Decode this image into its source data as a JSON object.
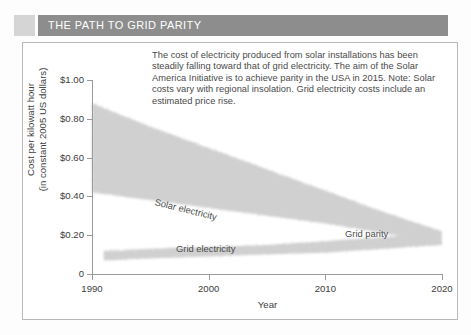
{
  "header": {
    "title": "THE PATH TO GRID PARITY",
    "swatch_color": "#d5d5d5",
    "bar_color": "#8d8d8d",
    "title_color": "#ffffff"
  },
  "caption": {
    "text": "The cost of electricity produced from solar installations has been steadily falling toward that of grid electricity. The aim of the Solar America Initiative is to achieve parity in the USA in 2015. Note: Solar costs vary with regional insolation. Grid electricity costs include an estimated price rise."
  },
  "chart_data": {
    "type": "area",
    "title": "THE PATH TO GRID PARITY",
    "xlabel": "Year",
    "ylabel": "Cost per kilowatt hour (in constant 2005 US dollars)",
    "ylabel_line1": "Cost per kilowatt hour",
    "ylabel_line2": "(in constant 2005 US dollars)",
    "xlim": [
      1990,
      2020
    ],
    "ylim": [
      0,
      1.0
    ],
    "grid": false,
    "legend": "none",
    "xticks": [
      1990,
      2000,
      2010,
      2020
    ],
    "xtick_labels": [
      "1990",
      "2000",
      "2010",
      "2020"
    ],
    "yticks": [
      0,
      0.2,
      0.4,
      0.6,
      0.8,
      1.0
    ],
    "ytick_labels": [
      "0",
      "$0.20",
      "$0.40",
      "$0.60",
      "$0.80",
      "$1.00"
    ],
    "band_color": "#d0d0d0",
    "series": [
      {
        "name": "Solar electricity",
        "type": "band",
        "x": [
          1990,
          1995,
          2000,
          2005,
          2010,
          2015,
          2020
        ],
        "upper": [
          0.88,
          0.76,
          0.65,
          0.54,
          0.43,
          0.32,
          0.22
        ],
        "lower": [
          0.42,
          0.38,
          0.34,
          0.3,
          0.26,
          0.21,
          0.16
        ]
      },
      {
        "name": "Grid electricity",
        "type": "band",
        "x": [
          1991,
          1995,
          2000,
          2005,
          2010,
          2015,
          2020
        ],
        "upper": [
          0.12,
          0.13,
          0.14,
          0.15,
          0.17,
          0.19,
          0.21
        ],
        "lower": [
          0.07,
          0.08,
          0.09,
          0.1,
          0.11,
          0.13,
          0.15
        ]
      }
    ],
    "annotations": [
      {
        "text": "Solar electricity",
        "x": 2001,
        "y": 0.4,
        "rotation": 14
      },
      {
        "text": "Grid electricity",
        "x": 2003,
        "y": 0.16,
        "rotation": 0
      },
      {
        "text": "Grid parity",
        "x": 2016,
        "y": 0.24,
        "rotation": 0
      }
    ]
  }
}
